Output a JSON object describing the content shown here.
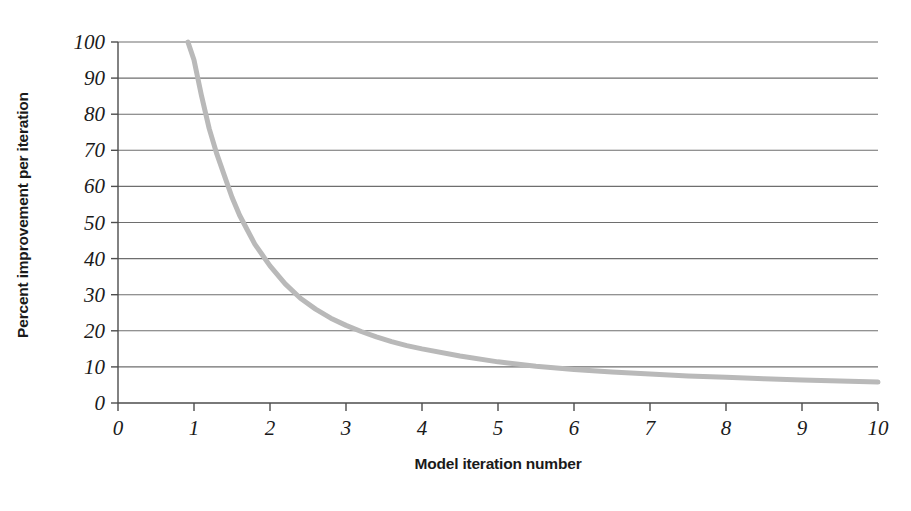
{
  "chart_data": {
    "type": "line",
    "title": "",
    "xlabel": "Model iteration number",
    "ylabel": "Percent improvement per iteration",
    "xlim": [
      0,
      10
    ],
    "ylim": [
      0,
      100
    ],
    "grid": true,
    "grid_axis": "y",
    "legend": "none",
    "x_ticks": [
      "0",
      "1",
      "2",
      "3",
      "4",
      "5",
      "6",
      "7",
      "8",
      "9",
      "10"
    ],
    "x_tick_values": [
      0,
      1,
      2,
      3,
      4,
      5,
      6,
      7,
      8,
      9,
      10
    ],
    "y_ticks": [
      "0",
      "10",
      "20",
      "30",
      "40",
      "50",
      "60",
      "70",
      "80",
      "90",
      "100"
    ],
    "y_tick_values": [
      0,
      10,
      20,
      30,
      40,
      50,
      60,
      70,
      80,
      90,
      100
    ],
    "series": [
      {
        "name": "Percent improvement per iteration",
        "color": "#b9b9b9",
        "line_width": 5,
        "x": [
          0.92,
          1.0,
          1.1,
          1.2,
          1.3,
          1.4,
          1.5,
          1.6,
          1.7,
          1.8,
          1.9,
          2.0,
          2.2,
          2.4,
          2.6,
          2.8,
          3.0,
          3.2,
          3.4,
          3.6,
          3.8,
          4.0,
          4.5,
          5.0,
          5.5,
          6.0,
          6.5,
          7.0,
          7.5,
          8.0,
          8.5,
          9.0,
          9.5,
          10.0
        ],
        "values": [
          100,
          95,
          85,
          76,
          69,
          63,
          57,
          52,
          48,
          44,
          41,
          38,
          33,
          29,
          26,
          23.5,
          21.5,
          19.8,
          18.3,
          17.0,
          15.9,
          15.0,
          13.0,
          11.4,
          10.2,
          9.3,
          8.6,
          8.0,
          7.5,
          7.1,
          6.7,
          6.4,
          6.1,
          5.8
        ]
      }
    ]
  },
  "axes": {
    "y_title": "Percent improvement per iteration",
    "x_title": "Model iteration number"
  },
  "style": {
    "background": "#ffffff",
    "axis_color": "#4d4d4d",
    "grid_color": "#6e6e6e",
    "curve_color": "#b9b9b9",
    "text_color": "#1a1a1a"
  }
}
